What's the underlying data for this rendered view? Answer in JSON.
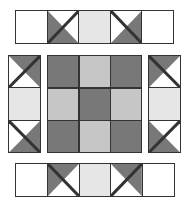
{
  "colors": {
    "dark": "#787878",
    "light": "#c6c6c6",
    "pale": "#e6e6e6",
    "white": "#ffffff",
    "line": "#333333"
  },
  "figure": {
    "top_strip": [
      "white",
      "tri-dark-bottom-left",
      "pale",
      "tri-dark-bottom-right",
      "white"
    ],
    "bottom_strip": [
      "white",
      "tri-dark-top-left",
      "pale",
      "tri-dark-top-right",
      "white"
    ],
    "left_strip": [
      "tri-dark-top-right",
      "pale",
      "tri-dark-bottom-right"
    ],
    "right_strip": [
      "tri-dark-top-left",
      "pale",
      "tri-dark-bottom-left"
    ],
    "center_grid": [
      [
        "dark",
        "light",
        "dark"
      ],
      [
        "light",
        "dark",
        "light"
      ],
      [
        "dark",
        "light",
        "dark"
      ]
    ]
  }
}
